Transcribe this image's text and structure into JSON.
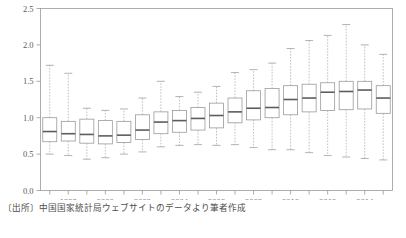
{
  "figure": {
    "source_note": "〔出所〕中国国家統計局ウェブサイトのデータより筆者作成"
  },
  "chart_data": {
    "type": "box",
    "title": "",
    "xlabel": "",
    "ylabel": "",
    "ylim": [
      0.0,
      2.5
    ],
    "xlim": [
      1996.5,
      2015.5
    ],
    "grid": false,
    "legend": null,
    "ytick_labels": [
      "0.0",
      "0.5",
      "1.0",
      "1.5",
      "2.0",
      "2.5"
    ],
    "yticks": [
      0.0,
      0.5,
      1.0,
      1.5,
      2.0,
      2.5
    ],
    "xtick_labels": [
      "1998",
      "2000",
      "2002",
      "2004",
      "2006",
      "2008",
      "2010",
      "2012",
      "2014"
    ],
    "xticks_labeled": [
      1998,
      2000,
      2002,
      2004,
      2006,
      2008,
      2010,
      2012,
      2014
    ],
    "xticks_all": [
      1997,
      1998,
      1999,
      2000,
      2001,
      2002,
      2003,
      2004,
      2005,
      2006,
      2007,
      2008,
      2009,
      2010,
      2011,
      2012,
      2013,
      2014,
      2015
    ],
    "categories": [
      1997,
      1998,
      1999,
      2000,
      2001,
      2002,
      2003,
      2004,
      2005,
      2006,
      2007,
      2008,
      2009,
      2010,
      2011,
      2012,
      2013,
      2014,
      2015
    ],
    "boxes": [
      {
        "x": 1997,
        "whisker_low": 0.5,
        "q1": 0.67,
        "median": 0.81,
        "q3": 1.0,
        "whisker_high": 1.72
      },
      {
        "x": 1998,
        "whisker_low": 0.48,
        "q1": 0.68,
        "median": 0.78,
        "q3": 0.95,
        "whisker_high": 1.61
      },
      {
        "x": 1999,
        "whisker_low": 0.43,
        "q1": 0.65,
        "median": 0.77,
        "q3": 0.98,
        "whisker_high": 1.13
      },
      {
        "x": 2000,
        "whisker_low": 0.45,
        "q1": 0.64,
        "median": 0.75,
        "q3": 0.96,
        "whisker_high": 1.1
      },
      {
        "x": 2001,
        "whisker_low": 0.5,
        "q1": 0.66,
        "median": 0.76,
        "q3": 0.95,
        "whisker_high": 1.12
      },
      {
        "x": 2002,
        "whisker_low": 0.53,
        "q1": 0.7,
        "median": 0.83,
        "q3": 1.04,
        "whisker_high": 1.27
      },
      {
        "x": 2003,
        "whisker_low": 0.6,
        "q1": 0.78,
        "median": 0.94,
        "q3": 1.08,
        "whisker_high": 1.5
      },
      {
        "x": 2004,
        "whisker_low": 0.62,
        "q1": 0.8,
        "median": 0.96,
        "q3": 1.1,
        "whisker_high": 1.29
      },
      {
        "x": 2005,
        "whisker_low": 0.63,
        "q1": 0.83,
        "median": 0.99,
        "q3": 1.14,
        "whisker_high": 1.35
      },
      {
        "x": 2006,
        "whisker_low": 0.62,
        "q1": 0.86,
        "median": 1.03,
        "q3": 1.2,
        "whisker_high": 1.43
      },
      {
        "x": 2007,
        "whisker_low": 0.63,
        "q1": 0.93,
        "median": 1.08,
        "q3": 1.27,
        "whisker_high": 1.62
      },
      {
        "x": 2008,
        "whisker_low": 0.59,
        "q1": 0.97,
        "median": 1.13,
        "q3": 1.37,
        "whisker_high": 1.66
      },
      {
        "x": 2009,
        "whisker_low": 0.56,
        "q1": 1.0,
        "median": 1.14,
        "q3": 1.4,
        "whisker_high": 1.75
      },
      {
        "x": 2010,
        "whisker_low": 0.56,
        "q1": 1.04,
        "median": 1.25,
        "q3": 1.44,
        "whisker_high": 1.95
      },
      {
        "x": 2011,
        "whisker_low": 0.52,
        "q1": 1.08,
        "median": 1.27,
        "q3": 1.46,
        "whisker_high": 2.06
      },
      {
        "x": 2012,
        "whisker_low": 0.48,
        "q1": 1.1,
        "median": 1.35,
        "q3": 1.48,
        "whisker_high": 2.13
      },
      {
        "x": 2013,
        "whisker_low": 0.46,
        "q1": 1.11,
        "median": 1.36,
        "q3": 1.5,
        "whisker_high": 2.28
      },
      {
        "x": 2014,
        "whisker_low": 0.44,
        "q1": 1.12,
        "median": 1.38,
        "q3": 1.5,
        "whisker_high": 2.0
      },
      {
        "x": 2015,
        "whisker_low": 0.42,
        "q1": 1.06,
        "median": 1.27,
        "q3": 1.44,
        "whisker_high": 1.87
      }
    ]
  }
}
